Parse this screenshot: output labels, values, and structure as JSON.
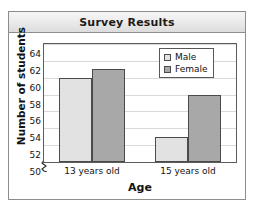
{
  "panel": {
    "title": "Survey Results"
  },
  "chart_data": {
    "type": "bar",
    "title": "Survey Results",
    "xlabel": "Age",
    "ylabel": "Number of students",
    "categories": [
      "13 years old",
      "15 years old"
    ],
    "series": [
      {
        "name": "Male",
        "values": [
          60,
          53
        ],
        "color": "#e2e2e2"
      },
      {
        "name": "Female",
        "values": [
          61,
          58
        ],
        "color": "#a8a8a8"
      }
    ],
    "ylim": [
      50,
      64
    ],
    "ytick_step": 2,
    "yticks": [
      50,
      52,
      54,
      56,
      58,
      60,
      62,
      64
    ],
    "axis_break": true,
    "grid": true,
    "legend_position": "top-right",
    "annotations": []
  },
  "legend": {
    "entries": [
      {
        "label": "Male"
      },
      {
        "label": "Female"
      }
    ]
  },
  "colors": {
    "male_fill": "#e2e2e2",
    "female_fill": "#a8a8a8",
    "bar_stroke": "#4a4a4a",
    "frame": "#5c5c5c",
    "grid": "#d9d9d9",
    "text": "#131313"
  }
}
